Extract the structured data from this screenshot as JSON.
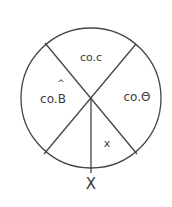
{
  "diagram": {
    "type": "napier-circle",
    "segments": [
      {
        "id": "top",
        "label": "co.c"
      },
      {
        "id": "right",
        "label": "co.Θ"
      },
      {
        "id": "left",
        "label": "co.B",
        "accent": "^"
      },
      {
        "id": "bottom-right",
        "label": "x"
      },
      {
        "id": "bottom-left",
        "label": ""
      }
    ],
    "bottom_label": "X",
    "stroke_color": "#444444"
  }
}
